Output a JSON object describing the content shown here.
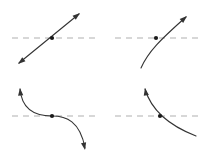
{
  "figure": {
    "background_color": "#ffffff",
    "width": 207,
    "height": 161,
    "curve_color": "#333333",
    "dashed_line_color": "#b0b0b0",
    "point_color": "#1a1a1a",
    "curve_stroke_width": 1.1,
    "dashed_stroke_width": 1.2,
    "dash_pattern": "6 5",
    "point_radius": 2.1
  },
  "chart_data": {
    "type": "line",
    "xlabel": "",
    "ylabel": "",
    "grid": false,
    "legend": "none",
    "panels": [
      {
        "id": "top-left",
        "name": "straight-line-double-arrow",
        "description": "Straight increasing line with arrowheads on both ends crossing the dashed reference line",
        "reference_line": {
          "y": 38,
          "x_start": 12,
          "x_end": 95
        },
        "crossing_point": {
          "x": 52,
          "y": 38
        },
        "path": "M 19,63 L 79,14",
        "arrowheads": [
          {
            "x": 80,
            "y": 13,
            "angle": -39
          },
          {
            "x": 18,
            "y": 64,
            "angle": 141
          }
        ]
      },
      {
        "id": "top-right",
        "name": "concave-down-increasing-curve",
        "description": "Concave-down increasing curve with one arrowhead at upper right crossing the dashed reference line",
        "reference_line": {
          "y": 38,
          "x_start": 115,
          "x_end": 200
        },
        "crossing_point": {
          "x": 156,
          "y": 38
        },
        "path": "M 141,68 C 148,52 160,40 186,17",
        "arrowheads": [
          {
            "x": 187,
            "y": 16,
            "angle": -42
          }
        ]
      },
      {
        "id": "bottom-left",
        "name": "s-shaped-decreasing-curve",
        "description": "S-shaped decreasing curve with arrowheads up-left and down-right, crossing the dashed reference line at its inflection point",
        "reference_line": {
          "y": 116,
          "x_start": 12,
          "x_end": 95
        },
        "crossing_point": {
          "x": 52,
          "y": 116
        },
        "path": "M 20,89 C 22,112 38,116 52,116 C 66,116 80,121 85,148",
        "arrowheads": [
          {
            "x": 20,
            "y": 88,
            "angle": -95
          },
          {
            "x": 85,
            "y": 150,
            "angle": 79
          }
        ]
      },
      {
        "id": "bottom-right",
        "name": "convex-decreasing-curve",
        "description": "Convex decreasing curve with one arrowhead at top crossing the dashed reference line",
        "reference_line": {
          "y": 116,
          "x_start": 115,
          "x_end": 200
        },
        "crossing_point": {
          "x": 160,
          "y": 116
        },
        "path": "M 145,89 C 150,106 165,124 196,136",
        "arrowheads": [
          {
            "x": 145,
            "y": 88,
            "angle": -100
          }
        ]
      }
    ]
  }
}
